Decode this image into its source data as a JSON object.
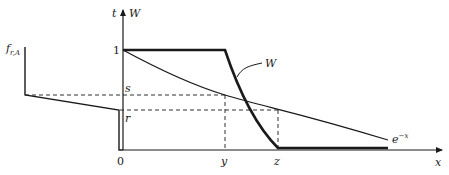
{
  "diagram": {
    "axes": {
      "y_label_left": "t",
      "y_label_right": "W",
      "x_label": "x",
      "origin_label": "0"
    },
    "tick_labels": {
      "one": "1",
      "s": "s",
      "r": "r",
      "y": "y",
      "z": "z"
    },
    "left_label": {
      "main": "f",
      "subscript": "r,A"
    },
    "curves": {
      "W_label": "W",
      "exp_label_base": "e",
      "exp_label_sup": "−x"
    },
    "colors": {
      "line": "#1a1a1a",
      "background": "#ffffff"
    }
  }
}
